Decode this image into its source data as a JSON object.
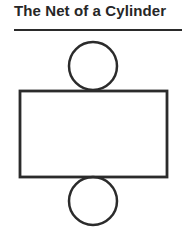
{
  "title": "The Net of a Cylinder",
  "diagram": {
    "stroke_color": "#2b2b2b",
    "top_circle": {
      "cx": 93,
      "cy": 66,
      "r": 24
    },
    "rectangle": {
      "x": 20,
      "y": 91,
      "width": 147,
      "height": 86
    },
    "bottom_circle": {
      "cx": 93,
      "cy": 201,
      "r": 24
    }
  }
}
